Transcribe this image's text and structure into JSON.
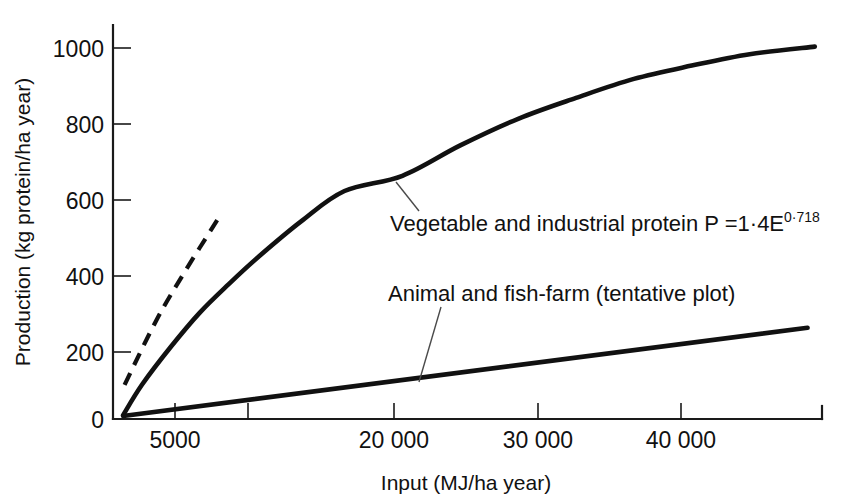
{
  "chart_data": {
    "type": "line",
    "title": "",
    "xlabel": "Input (MJ/ha year)",
    "ylabel": "Production (kg protein/ha year)",
    "xlim": [
      0,
      49000
    ],
    "ylim": [
      0,
      1080
    ],
    "grid": false,
    "legend_position": "inline-annotations",
    "x_ticks": [
      {
        "value": 5000,
        "label": "5000"
      },
      {
        "value": 10000,
        "label": ""
      },
      {
        "value": 20000,
        "label": "20 000"
      },
      {
        "value": 30000,
        "label": "30 000"
      },
      {
        "value": 40000,
        "label": "40 000"
      }
    ],
    "y_ticks": [
      {
        "value": 0,
        "label": "0"
      },
      {
        "value": 200,
        "label": "200"
      },
      {
        "value": 400,
        "label": "400"
      },
      {
        "value": 600,
        "label": "600"
      },
      {
        "value": 800,
        "label": "800"
      },
      {
        "value": 1000,
        "label": "1000"
      }
    ],
    "series": [
      {
        "name": "Vegetable and industrial protein",
        "style": "solid",
        "equation": "P =1·4E",
        "exponent": "0·718",
        "x": [
          700,
          2000,
          4000,
          6000,
          8000,
          10000,
          13000,
          16000,
          20000,
          24000,
          28000,
          32000,
          36000,
          40000,
          44000,
          48500
        ],
        "y": [
          10,
          90,
          190,
          280,
          355,
          425,
          520,
          600,
          640,
          720,
          790,
          845,
          895,
          930,
          960,
          980
        ]
      },
      {
        "name": "Animal and fish-farm (tentative plot)",
        "style": "solid",
        "x": [
          700,
          48000
        ],
        "y": [
          8,
          240
        ]
      },
      {
        "name": "unlabelled extrapolation",
        "style": "dashed",
        "x": [
          800,
          3000,
          5000,
          7400
        ],
        "y": [
          90,
          260,
          390,
          535
        ]
      }
    ],
    "annotations": [
      {
        "id": "vegetable-annotation",
        "text_main": "Vegetable and industrial protein P =1·4E",
        "text_sup": "0·718",
        "x": 390,
        "y": 224,
        "leader": {
          "x1": 396,
          "y1": 182,
          "x2": 419,
          "y2": 211
        }
      },
      {
        "id": "animal-annotation",
        "text_main": "Animal and fish-farm (tentative plot)",
        "text_sup": "",
        "x": 388,
        "y": 301,
        "leader": {
          "x1": 441,
          "y1": 307,
          "x2": 419,
          "y2": 382
        }
      }
    ],
    "colors": {
      "line": "#111111",
      "axis": "#1a1a1a",
      "background": "#ffffff",
      "leader": "#4a4a4a"
    }
  },
  "axes": {
    "y_title": "Production (kg protein/ha year)",
    "x_title": "Input (MJ/ha year)"
  },
  "tick_labels": {
    "y": [
      "1000",
      "800",
      "600",
      "400",
      "200",
      "0"
    ],
    "x": [
      "5000",
      "20 000",
      "30 000",
      "40 000"
    ]
  },
  "annotation_labels": {
    "vegetable_main": "Vegetable and industrial protein P =1·4E",
    "vegetable_sup": "0·718",
    "animal_main": "Animal and fish-farm (tentative plot)"
  }
}
